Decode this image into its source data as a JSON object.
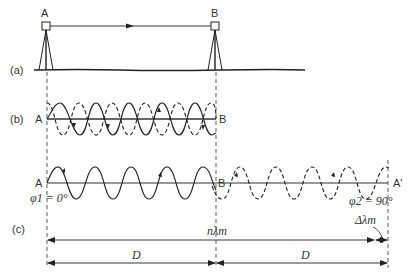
{
  "diagram": {
    "type": "phase-measurement distance principle",
    "panels": [
      {
        "id": "a",
        "label": "(a)",
        "description": "Instruments at stations A and B on ground with signal path A to B"
      },
      {
        "id": "b",
        "label": "(b)",
        "description": "Outgoing (solid) and returning (dashed) waves between A and B"
      },
      {
        "id": "c",
        "label": "(c)",
        "description": "Unfolded double path A to B to A' with phase difference"
      }
    ],
    "stations": {
      "a_top": "A",
      "b_top": "B",
      "a_b_left": "A",
      "b_b_right": "B",
      "a_c_left": "A",
      "b_c_mid": "B",
      "a_prime": "A'"
    },
    "phases": {
      "phi1": "φ1 = 0°",
      "phi2": "φ2 = 90°"
    },
    "dimensions": {
      "n_lambda": "nλm",
      "delta_lambda": "Δλm",
      "d_left": "D",
      "d_right": "D"
    },
    "colors": {
      "line": "#222222",
      "text": "#333333",
      "background": "#ffffff"
    }
  }
}
